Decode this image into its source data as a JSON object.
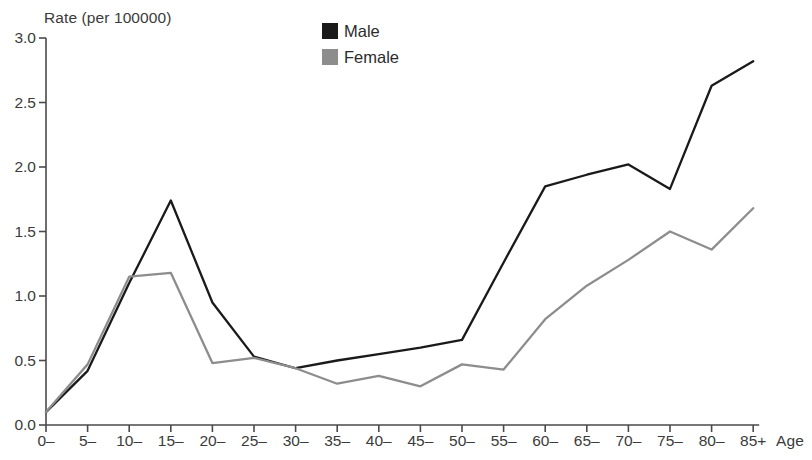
{
  "chart_data": {
    "type": "line",
    "title": "",
    "subtitle": "",
    "xlabel": "Age",
    "ylabel": "Rate (per 100000)",
    "categories": [
      "0–",
      "5–",
      "10–",
      "15–",
      "20–",
      "25–",
      "30–",
      "35–",
      "40–",
      "45–",
      "50–",
      "55–",
      "60–",
      "65–",
      "70–",
      "75–",
      "80–",
      "85+"
    ],
    "series": [
      {
        "name": "Male",
        "color": "#1a1a1a",
        "values": [
          0.1,
          0.42,
          1.1,
          1.74,
          0.95,
          0.53,
          0.44,
          0.5,
          0.55,
          0.6,
          0.66,
          1.26,
          1.85,
          1.94,
          2.02,
          1.83,
          2.63,
          2.82
        ]
      },
      {
        "name": "Female",
        "color": "#8d8d8d",
        "values": [
          0.1,
          0.47,
          1.15,
          1.18,
          0.48,
          0.52,
          0.44,
          0.32,
          0.38,
          0.3,
          0.47,
          0.43,
          0.82,
          1.08,
          1.28,
          1.5,
          1.36,
          1.68
        ]
      }
    ],
    "ylim": [
      0.0,
      3.0
    ],
    "ytick_labels": [
      "0.0",
      "0.5",
      "1.0",
      "1.5",
      "2.0",
      "2.5",
      "3.0"
    ],
    "ytick_values": [
      0.0,
      0.5,
      1.0,
      1.5,
      2.0,
      2.5,
      3.0
    ],
    "grid": false,
    "legend_position": "top-center"
  },
  "axes": {
    "y_title": "Rate (per 100000)",
    "x_title": "Age"
  },
  "legend": {
    "items": [
      {
        "label": "Male",
        "color": "#1a1a1a"
      },
      {
        "label": "Female",
        "color": "#8d8d8d"
      }
    ]
  },
  "style": {
    "axis_color": "#4a4a4a",
    "background": "#ffffff",
    "text_color": "#3b3b3b"
  }
}
